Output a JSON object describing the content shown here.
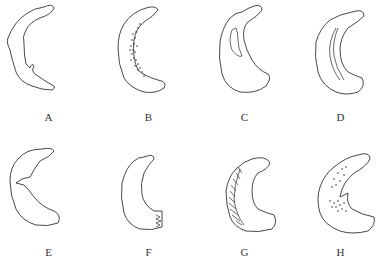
{
  "figure": {
    "panels": [
      {
        "label": "A",
        "description": "crescent with irregular inner margin"
      },
      {
        "label": "B",
        "description": "crescent with stippled dots along inner margin"
      },
      {
        "label": "C",
        "description": "crescent with longitudinal inner split"
      },
      {
        "label": "D",
        "description": "crescent with longitudinal tear line"
      },
      {
        "label": "E",
        "description": "crescent with radial notch at mid inner margin"
      },
      {
        "label": "F",
        "description": "crescent with frayed posterior end"
      },
      {
        "label": "G",
        "description": "crescent with hatched outer rim"
      },
      {
        "label": "H",
        "description": "crescent with flap and stippled regions"
      }
    ]
  }
}
